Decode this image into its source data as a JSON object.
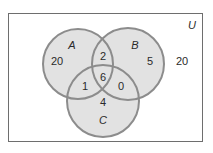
{
  "diagram": {
    "type": "venn",
    "universe_label": "U",
    "sets": [
      {
        "label": "A",
        "cx": 78,
        "cy": 64,
        "r": 35
      },
      {
        "label": "B",
        "cx": 128,
        "cy": 64,
        "r": 36
      },
      {
        "label": "C",
        "cx": 103,
        "cy": 101,
        "r": 36
      }
    ],
    "regions": {
      "A_only": "20",
      "B_only": "5",
      "C_only": "4",
      "A_and_B_only": "2",
      "A_and_C_only": "1",
      "B_and_C_only": "0",
      "A_and_B_and_C": "6",
      "outside": "20"
    },
    "colors": {
      "fill": "#e2e2e2",
      "stroke": "#8c8c8c",
      "border": "#6e6e6e",
      "text": "#2a2a2a"
    }
  }
}
